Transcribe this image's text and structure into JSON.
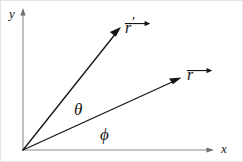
{
  "figure": {
    "kind": "vector-angle-diagram",
    "width": 243,
    "height": 162,
    "background_color": "#ffffff",
    "frame_color": "#e4e4e4",
    "axis_color": "#8c8c8c",
    "vector_color": "#161616"
  },
  "axes": {
    "origin": {
      "x": 23,
      "y": 150
    },
    "x_axis": {
      "label": "x",
      "label_x": 221,
      "label_y": 142,
      "from": {
        "x": 23,
        "y": 150
      },
      "to": {
        "x": 211,
        "y": 150
      }
    },
    "y_axis": {
      "label": "y",
      "label_x": 9,
      "label_y": 7,
      "from": {
        "x": 23,
        "y": 150
      },
      "to": {
        "x": 23,
        "y": 12
      }
    }
  },
  "vectors": [
    {
      "name": "r-prime",
      "symbol": "r",
      "prime": "′",
      "has_overarrow": true,
      "label_x": 124,
      "label_y": 16,
      "from": {
        "x": 23,
        "y": 150
      },
      "to": {
        "x": 120,
        "y": 28
      }
    },
    {
      "name": "r",
      "symbol": "r",
      "prime": "",
      "has_overarrow": true,
      "label_x": 186,
      "label_y": 67,
      "from": {
        "x": 23,
        "y": 150
      },
      "to": {
        "x": 181,
        "y": 78
      }
    }
  ],
  "angles": [
    {
      "name": "theta",
      "label": "θ",
      "label_x": 74,
      "label_y": 101,
      "between": [
        "r-prime",
        "r"
      ]
    },
    {
      "name": "phi",
      "label": "ϕ",
      "label_x": 100,
      "label_y": 126,
      "between": [
        "r",
        "x-axis"
      ]
    }
  ]
}
